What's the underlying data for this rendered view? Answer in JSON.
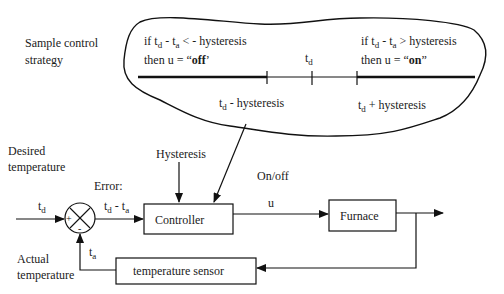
{
  "strategy": {
    "label_line1": "Sample control",
    "label_line2": "strategy",
    "left_rule": {
      "prefix": "if t",
      "sub1": "d",
      "mid": " - t",
      "sub2": "a",
      "rest": " < -  hysteresis",
      "then": "then u = “",
      "value": "off",
      "close": "’"
    },
    "right_rule": {
      "prefix": "if t",
      "sub1": "d",
      "mid": " - t",
      "sub2": "a",
      "rest": " >  hysteresis",
      "then": "then u = “",
      "value": "on",
      "close": "”"
    },
    "axis_center": {
      "t": "t",
      "sub": "d"
    },
    "axis_left": {
      "t": "t",
      "sub": "d",
      "rest": " - hysteresis"
    },
    "axis_right": {
      "t": "t",
      "sub": "d",
      "rest": " + hysteresis"
    }
  },
  "block_diagram": {
    "desired_line1": "Desired",
    "desired_line2": "temperature",
    "input_signal": {
      "t": "t",
      "sub": "d"
    },
    "plus_sign": "+",
    "minus_sign": "-",
    "error_label": "Error:",
    "error_signal": {
      "t": "t",
      "sub1": "d",
      "mid": " - t",
      "sub2": "a"
    },
    "hysteresis_label": "Hysteresis",
    "controller_label": "Controller",
    "onoff_label": "On/off",
    "u_label": "u",
    "furnace_label": "Furnace",
    "sensor_label": "temperature sensor",
    "feedback_signal": {
      "t": "t",
      "sub": "a"
    },
    "actual_line1": "Actual",
    "actual_line2": "temperature"
  }
}
